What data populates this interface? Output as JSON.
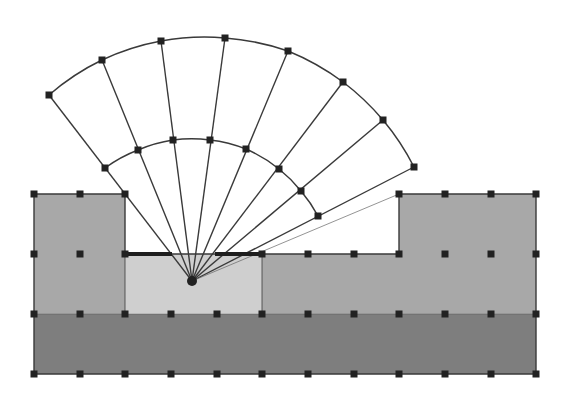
{
  "diagram": {
    "title": "",
    "width": 562,
    "height": 396,
    "colors": {
      "background": "#ffffff",
      "mid_gray": "#a8a8a8",
      "light_gray": "#cfcfcf",
      "dark_gray": "#7e7e7e",
      "line": "#3a3a3a",
      "node": "#222222",
      "thick_edge": "#1e1e1e",
      "thin_line": "#666666"
    },
    "grid": {
      "x": [
        34,
        80,
        125,
        171,
        217,
        262,
        308,
        354,
        399,
        445,
        491,
        536
      ],
      "y": [
        194,
        254,
        314,
        374
      ]
    },
    "regions": [
      {
        "name": "left-block",
        "fill": "mid_gray",
        "x": 34,
        "y": 194,
        "w": 91,
        "h": 120
      },
      {
        "name": "center-block",
        "fill": "light_gray",
        "x": 125,
        "y": 254,
        "w": 137,
        "h": 60
      },
      {
        "name": "right-middle-block",
        "fill": "mid_gray",
        "x": 262,
        "y": 254,
        "w": 137,
        "h": 60
      },
      {
        "name": "right-block",
        "fill": "mid_gray",
        "x": 399,
        "y": 194,
        "w": 137,
        "h": 120
      },
      {
        "name": "bottom-band",
        "fill": "dark_gray",
        "x": 34,
        "y": 314,
        "w": 502,
        "h": 60
      }
    ],
    "outline": "34,194 125,194 125,254 399,254 399,194 536,194 536,374 34,374",
    "thick_edges": [
      {
        "x1": 125,
        "y1": 254,
        "x2": 172,
        "y2": 254
      },
      {
        "x1": 215,
        "y1": 254,
        "x2": 263,
        "y2": 254
      }
    ],
    "fan": {
      "origin": {
        "x": 192,
        "y": 281
      },
      "outer_nodes": [
        [
          49,
          95
        ],
        [
          102,
          60
        ],
        [
          161,
          41
        ],
        [
          225,
          38
        ],
        [
          288,
          51
        ],
        [
          343,
          82
        ],
        [
          383,
          120
        ],
        [
          414,
          167
        ]
      ],
      "inner_nodes": [
        [
          105,
          168
        ],
        [
          138,
          150
        ],
        [
          173,
          140
        ],
        [
          210,
          140
        ],
        [
          246,
          149
        ],
        [
          279,
          169
        ],
        [
          301,
          191
        ],
        [
          318,
          216
        ]
      ],
      "thin_ray_end": {
        "x": 399,
        "y": 194
      }
    },
    "grid_nodes": [
      [
        34,
        194
      ],
      [
        80,
        194
      ],
      [
        125,
        194
      ],
      [
        399,
        194
      ],
      [
        445,
        194
      ],
      [
        491,
        194
      ],
      [
        536,
        194
      ],
      [
        34,
        254
      ],
      [
        80,
        254
      ],
      [
        125,
        254
      ],
      [
        262,
        254
      ],
      [
        308,
        254
      ],
      [
        354,
        254
      ],
      [
        399,
        254
      ],
      [
        445,
        254
      ],
      [
        491,
        254
      ],
      [
        536,
        254
      ],
      [
        34,
        314
      ],
      [
        80,
        314
      ],
      [
        125,
        314
      ],
      [
        171,
        314
      ],
      [
        217,
        314
      ],
      [
        262,
        314
      ],
      [
        308,
        314
      ],
      [
        354,
        314
      ],
      [
        399,
        314
      ],
      [
        445,
        314
      ],
      [
        491,
        314
      ],
      [
        536,
        314
      ],
      [
        34,
        374
      ],
      [
        80,
        374
      ],
      [
        125,
        374
      ],
      [
        171,
        374
      ],
      [
        217,
        374
      ],
      [
        262,
        374
      ],
      [
        308,
        374
      ],
      [
        354,
        374
      ],
      [
        399,
        374
      ],
      [
        445,
        374
      ],
      [
        491,
        374
      ],
      [
        536,
        374
      ]
    ]
  }
}
